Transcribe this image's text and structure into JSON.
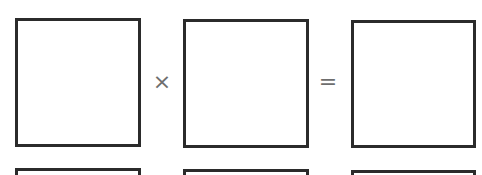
{
  "equation": {
    "operator_times": "×",
    "operator_equals": "=",
    "row1": {
      "boxes": [
        "",
        "",
        ""
      ]
    },
    "row2": {
      "boxes": [
        "",
        "",
        ""
      ]
    }
  },
  "colors": {
    "border": "#2b2b2b",
    "operator": "#6e6e6e",
    "background": "#ffffff"
  }
}
